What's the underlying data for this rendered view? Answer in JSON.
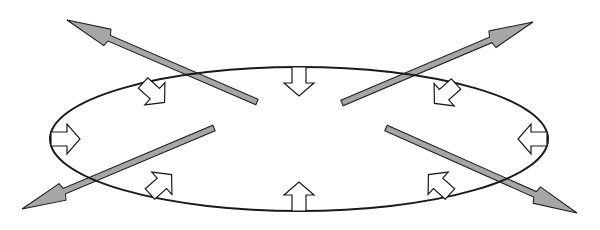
{
  "diagram": {
    "title": "",
    "colors": {
      "background": "#ffffff",
      "outline": "#1a1a1a",
      "outward_arrow_fill": "#a6a6a6",
      "inward_arrow_fill": "#ffffff"
    },
    "ellipse": {
      "cx": 299,
      "cy": 139,
      "rx": 249,
      "ry": 72
    },
    "outward_arrows": [
      {
        "id": "upper-left",
        "from": [
          257,
          102
        ],
        "to": [
          67,
          20
        ]
      },
      {
        "id": "upper-right",
        "from": [
          342,
          103
        ],
        "to": [
          533,
          22
        ]
      },
      {
        "id": "lower-left",
        "from": [
          214,
          128
        ],
        "to": [
          22,
          209
        ]
      },
      {
        "id": "lower-right",
        "from": [
          386,
          128
        ],
        "to": [
          577,
          213
        ]
      }
    ],
    "inward_arrows": [
      {
        "id": "top",
        "at": [
          299,
          67
        ],
        "angle": 90
      },
      {
        "id": "bottom",
        "at": [
          299,
          211
        ],
        "angle": -90
      },
      {
        "id": "left",
        "at": [
          51,
          139
        ],
        "angle": 0
      },
      {
        "id": "right",
        "at": [
          547,
          139
        ],
        "angle": 180
      },
      {
        "id": "upper-left",
        "at": [
          143,
          83
        ],
        "angle": 42
      },
      {
        "id": "upper-right",
        "at": [
          456,
          84
        ],
        "angle": 138
      },
      {
        "id": "lower-left",
        "at": [
          150,
          194
        ],
        "angle": -42
      },
      {
        "id": "lower-right",
        "at": [
          450,
          194
        ],
        "angle": -138
      }
    ]
  }
}
